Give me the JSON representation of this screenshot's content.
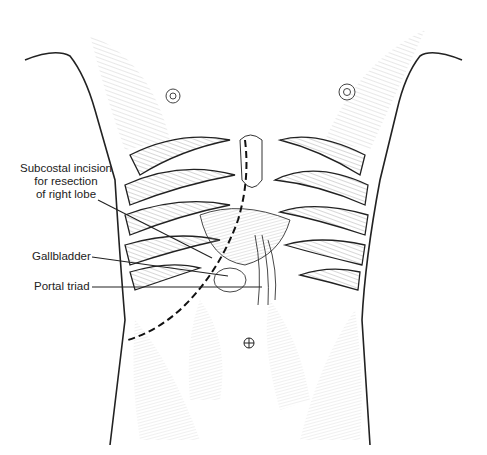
{
  "figure": {
    "labels": [
      {
        "id": "incision",
        "lines": [
          "Subcostal incision",
          "for resection",
          "of right lobe"
        ]
      },
      {
        "id": "gallbladder",
        "lines": [
          "Gallbladder"
        ]
      },
      {
        "id": "portal",
        "lines": [
          "Portal triad"
        ]
      }
    ]
  },
  "colors": {
    "line": "#222222",
    "hatch": "#555555",
    "background": "#ffffff"
  }
}
